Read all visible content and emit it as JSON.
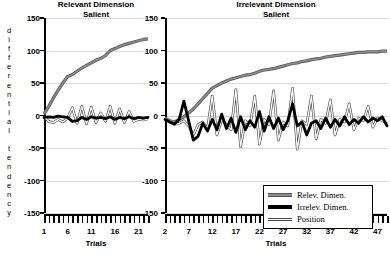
{
  "figure": {
    "y_axis_caption": "differential tendency",
    "x_axis_title": "Trials"
  },
  "chart_data": {
    "type": "line",
    "title": "",
    "ylabel": "differential tendency",
    "xlabel": "Trials",
    "ylim": [
      -150,
      150
    ],
    "yticks": [
      150,
      100,
      50,
      0,
      -50,
      -100,
      -150
    ],
    "grid": true,
    "legend": {
      "position": "lower-right",
      "entries": [
        "Relev. Dimen.",
        "Irrelev. Dimen.",
        "Position"
      ]
    },
    "panels": [
      {
        "title_line1": "Relevant Dimension",
        "title_line2": "Salient",
        "xlim": [
          1,
          23
        ],
        "xticks": [
          1,
          6,
          11,
          16,
          21
        ],
        "xtick_labels": [
          "1",
          "6",
          "11",
          "16",
          "21"
        ],
        "x": [
          1,
          2,
          3,
          4,
          5,
          6,
          7,
          8,
          9,
          10,
          11,
          12,
          13,
          14,
          15,
          16,
          17,
          18,
          19,
          20,
          21,
          22,
          23
        ],
        "series": [
          {
            "name": "Relev. Dimen.",
            "color": "#8c8c8c",
            "values": [
              2,
              14,
              27,
              39,
              50,
              60,
              63,
              68,
              73,
              77,
              81,
              85,
              88,
              92,
              100,
              103,
              106,
              109,
              111,
              113,
              115,
              117,
              118
            ]
          },
          {
            "name": "Irrelev. Dimen.",
            "color": "#000000",
            "values": [
              -3,
              -2,
              -3,
              -1,
              -2,
              -3,
              -9,
              -8,
              -3,
              -6,
              -2,
              -4,
              -3,
              -5,
              -2,
              -6,
              -3,
              -5,
              -2,
              -5,
              -3,
              -4,
              -3
            ]
          },
          {
            "name": "Position",
            "color": "#ffffff",
            "values": [
              -2,
              -9,
              -11,
              -6,
              -10,
              -4,
              12,
              -12,
              14,
              -13,
              13,
              -11,
              4,
              -9,
              14,
              -12,
              10,
              -11,
              6,
              -9,
              -6,
              -7,
              -5
            ]
          }
        ]
      },
      {
        "title_line1": "Irrelevant Dimension",
        "title_line2": "Salient",
        "xlim": [
          2,
          49
        ],
        "xticks": [
          2,
          7,
          12,
          17,
          22,
          27,
          32,
          37,
          42,
          47
        ],
        "xtick_labels": [
          "2",
          "7",
          "12",
          "17",
          "22",
          "27",
          "32",
          "37",
          "42",
          "47"
        ],
        "x": [
          2,
          3,
          4,
          5,
          6,
          7,
          8,
          9,
          10,
          11,
          12,
          13,
          14,
          15,
          16,
          17,
          18,
          19,
          20,
          21,
          22,
          23,
          24,
          25,
          26,
          27,
          28,
          29,
          30,
          31,
          32,
          33,
          34,
          35,
          36,
          37,
          38,
          39,
          40,
          41,
          42,
          43,
          44,
          45,
          46,
          47,
          48,
          49
        ],
        "series": [
          {
            "name": "Relev. Dimen.",
            "color": "#8c8c8c",
            "values": [
              -4,
              -8,
              -10,
              -6,
              -2,
              4,
              10,
              18,
              26,
              34,
              42,
              46,
              50,
              53,
              56,
              58,
              60,
              62,
              63,
              65,
              68,
              70,
              71,
              72,
              74,
              76,
              78,
              80,
              81,
              83,
              84,
              86,
              87,
              88,
              90,
              91,
              92,
              93,
              94,
              95,
              96,
              97,
              97,
              98,
              98,
              98,
              99,
              99
            ]
          },
          {
            "name": "Irrelev. Dimen.",
            "color": "#000000",
            "values": [
              -6,
              -10,
              -13,
              -6,
              22,
              -8,
              -38,
              -32,
              -12,
              -24,
              -6,
              -22,
              2,
              -20,
              -4,
              -26,
              -2,
              -22,
              -8,
              -18,
              6,
              -24,
              -2,
              -20,
              -4,
              -22,
              -8,
              18,
              -16,
              -10,
              -30,
              -12,
              -8,
              -20,
              -4,
              -18,
              -6,
              -16,
              -2,
              -14,
              -6,
              -12,
              -2,
              -10,
              -4,
              -8,
              -2,
              -16
            ]
          },
          {
            "name": "Position",
            "color": "#ffffff",
            "values": [
              -4,
              -10,
              -14,
              -12,
              -8,
              -16,
              -30,
              -14,
              -10,
              -20,
              30,
              -30,
              -6,
              -14,
              -22,
              40,
              -48,
              -8,
              -16,
              30,
              -44,
              -6,
              -14,
              38,
              -38,
              -10,
              -16,
              42,
              -52,
              -8,
              -14,
              30,
              -36,
              -6,
              -12,
              24,
              -30,
              -6,
              -10,
              18,
              -22,
              -4,
              -8,
              14,
              -18,
              -4,
              -8,
              -12
            ]
          }
        ]
      }
    ]
  }
}
